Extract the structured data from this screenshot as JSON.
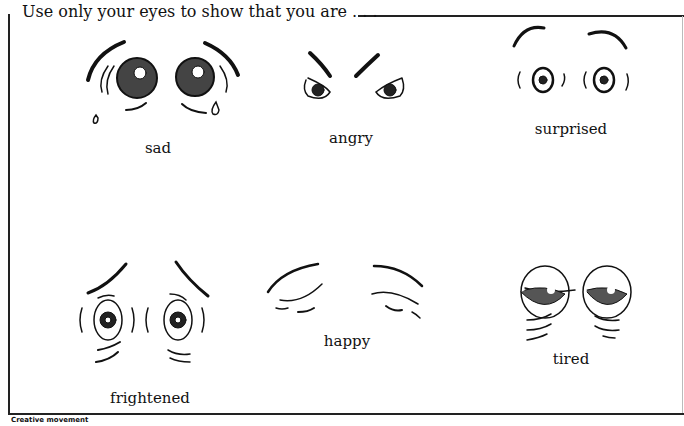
{
  "heading": "Use only your eyes to show that you are . . .",
  "footer": "Creative movement",
  "emotions": [
    {
      "label": "sad"
    },
    {
      "label": "angry"
    },
    {
      "label": "surprised"
    },
    {
      "label": "frightened"
    },
    {
      "label": "happy"
    },
    {
      "label": "tired"
    }
  ]
}
